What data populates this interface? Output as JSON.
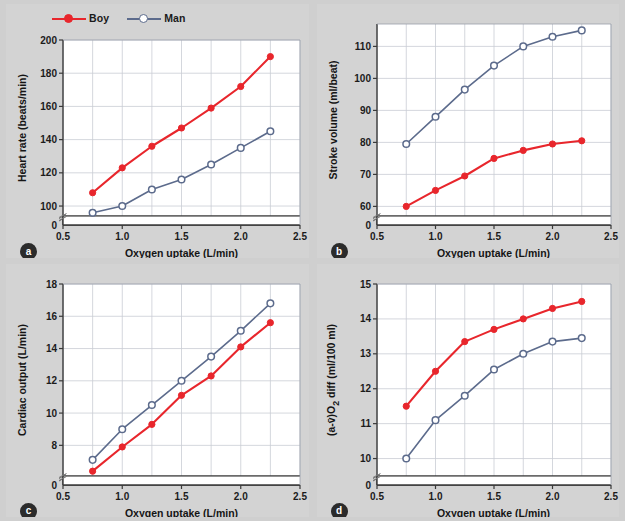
{
  "figure": {
    "background": "#cfcfcf",
    "panel_background": "#d3d3d3",
    "plot_background": "#ffffff"
  },
  "legend": {
    "position": "top-left of panel a",
    "items": [
      {
        "label": "Boy",
        "color": "#e8262c",
        "marker": "filled-circle"
      },
      {
        "label": "Man",
        "color": "#5c6b8c",
        "marker": "open-circle"
      }
    ]
  },
  "panels": [
    {
      "id": "a",
      "badge": "a"
    },
    {
      "id": "b",
      "badge": "b"
    },
    {
      "id": "c",
      "badge": "c"
    },
    {
      "id": "d",
      "badge": "d"
    }
  ],
  "chart_data": [
    {
      "panel": "a",
      "type": "line",
      "title": "",
      "xlabel": "Oxygen uptake (L/min)",
      "ylabel": "Heart rate (beats/min)",
      "x": [
        0.75,
        1.0,
        1.25,
        1.5,
        1.75,
        2.0,
        2.25
      ],
      "xlim": [
        0.5,
        2.5
      ],
      "xticks": [
        0.5,
        1.0,
        1.5,
        2.0,
        2.5
      ],
      "xticklabels": [
        "0.5",
        "1.0",
        "1.5",
        "2.0",
        "2.5"
      ],
      "ylim": [
        94,
        200
      ],
      "yticks": [
        100,
        120,
        140,
        160,
        180,
        200
      ],
      "yticklabels": [
        "100",
        "120",
        "140",
        "160",
        "180",
        "200"
      ],
      "y_origin_label": "0",
      "axis_break": true,
      "grid": true,
      "series": [
        {
          "name": "Boy",
          "color": "#e8262c",
          "marker": "filled-circle",
          "values": [
            108,
            123,
            136,
            147,
            159,
            172,
            190
          ]
        },
        {
          "name": "Man",
          "color": "#5c6b8c",
          "marker": "open-circle",
          "values": [
            96,
            100,
            110,
            116,
            125,
            135,
            145
          ]
        }
      ]
    },
    {
      "panel": "b",
      "type": "line",
      "title": "",
      "xlabel": "Oxygen uptake (L/min)",
      "ylabel": "Stroke volume (ml/beat)",
      "x": [
        0.75,
        1.0,
        1.25,
        1.5,
        1.75,
        2.0,
        2.25
      ],
      "xlim": [
        0.5,
        2.5
      ],
      "xticks": [
        0.5,
        1.0,
        1.5,
        2.0,
        2.5
      ],
      "xticklabels": [
        "0.5",
        "1.0",
        "1.5",
        "2.0",
        "2.5"
      ],
      "ylim": [
        57,
        117
      ],
      "yticks": [
        60,
        70,
        80,
        90,
        100,
        110
      ],
      "yticklabels": [
        "60",
        "70",
        "80",
        "90",
        "100",
        "110"
      ],
      "y_origin_label": "0",
      "axis_break": true,
      "grid": true,
      "series": [
        {
          "name": "Boy",
          "color": "#e8262c",
          "marker": "filled-circle",
          "values": [
            60,
            65,
            69.5,
            75,
            77.5,
            79.5,
            80.5
          ]
        },
        {
          "name": "Man",
          "color": "#5c6b8c",
          "marker": "open-circle",
          "values": [
            79.5,
            88,
            96.5,
            104,
            110,
            113,
            115
          ]
        }
      ]
    },
    {
      "panel": "c",
      "type": "line",
      "title": "",
      "xlabel": "Oxygen uptake (L/min)",
      "ylabel": "Cardiac output (L/min)",
      "x": [
        0.75,
        1.0,
        1.25,
        1.5,
        1.75,
        2.0,
        2.25
      ],
      "xlim": [
        0.5,
        2.5
      ],
      "xticks": [
        0.5,
        1.0,
        1.5,
        2.0,
        2.5
      ],
      "xticklabels": [
        "0.5",
        "1.0",
        "1.5",
        "2.0",
        "2.5"
      ],
      "ylim": [
        6.1,
        18
      ],
      "yticks": [
        8,
        10,
        12,
        14,
        16,
        18
      ],
      "yticklabels": [
        "8",
        "10",
        "12",
        "14",
        "16",
        "18"
      ],
      "y_origin_label": "0",
      "axis_break": true,
      "grid": true,
      "series": [
        {
          "name": "Boy",
          "color": "#e8262c",
          "marker": "filled-circle",
          "values": [
            6.4,
            7.9,
            9.3,
            11.1,
            12.3,
            14.1,
            15.6
          ]
        },
        {
          "name": "Man",
          "color": "#5c6b8c",
          "marker": "open-circle",
          "values": [
            7.1,
            9.0,
            10.5,
            12.0,
            13.5,
            15.1,
            16.8
          ]
        }
      ]
    },
    {
      "panel": "d",
      "type": "line",
      "title": "",
      "xlabel": "Oxygen uptake (L/min)",
      "ylabel_html": "(a-v̄)O<sub>2</sub> diff (ml/100 ml)",
      "ylabel": "(a-v̄)O2 diff (ml/100 ml)",
      "x": [
        0.75,
        1.0,
        1.25,
        1.5,
        1.75,
        2.0,
        2.25
      ],
      "xlim": [
        0.5,
        2.5
      ],
      "xticks": [
        0.5,
        1.0,
        1.5,
        2.0,
        2.5
      ],
      "xticklabels": [
        "0.5",
        "1.0",
        "1.5",
        "2.0",
        "2.5"
      ],
      "ylim": [
        9.5,
        15
      ],
      "yticks": [
        10,
        11,
        12,
        13,
        14,
        15
      ],
      "yticklabels": [
        "10",
        "11",
        "12",
        "13",
        "14",
        "15"
      ],
      "y_origin_label": "0",
      "axis_break": true,
      "grid": true,
      "series": [
        {
          "name": "Boy",
          "color": "#e8262c",
          "marker": "filled-circle",
          "values": [
            11.5,
            12.5,
            13.35,
            13.7,
            14.0,
            14.3,
            14.5
          ]
        },
        {
          "name": "Man",
          "color": "#5c6b8c",
          "marker": "open-circle",
          "values": [
            10.0,
            11.1,
            11.8,
            12.55,
            13.0,
            13.35,
            13.45
          ]
        }
      ]
    }
  ]
}
